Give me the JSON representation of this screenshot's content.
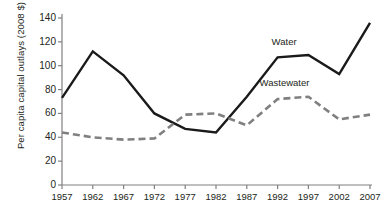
{
  "chart_data": {
    "type": "line",
    "title": "",
    "xlabel": "",
    "ylabel": "Per capita capital outlays (2008 $)",
    "categories": [
      "1957",
      "1962",
      "1967",
      "1972",
      "1977",
      "1982",
      "1987",
      "1992",
      "1997",
      "2002",
      "2007"
    ],
    "xlim": [
      1957,
      2007
    ],
    "ylim": [
      0,
      140
    ],
    "yticks": [
      "0",
      "20",
      "40",
      "60",
      "80",
      "100",
      "120",
      "140"
    ],
    "ytick_values": [
      0,
      20,
      40,
      60,
      80,
      100,
      120,
      140
    ],
    "grid": false,
    "legend_position": "inline-annotation",
    "series": [
      {
        "name": "Water",
        "style": "solid",
        "color": "#1a1a1a",
        "values": [
          73,
          112,
          92,
          60,
          47,
          44,
          74,
          107,
          109,
          93,
          136
        ],
        "label_text": "Water"
      },
      {
        "name": "Wastewater",
        "style": "dashed",
        "color": "#808080",
        "values": [
          44,
          40,
          38,
          39,
          59,
          60,
          50,
          72,
          74,
          55,
          59
        ],
        "label_text": "Wastewater"
      }
    ]
  },
  "axis": {
    "line_color": "#808080",
    "tick_color": "#808080"
  }
}
